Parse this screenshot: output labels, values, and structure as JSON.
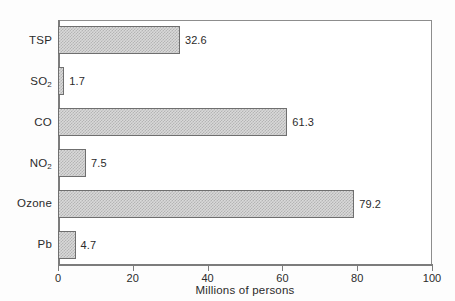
{
  "chart_data": {
    "type": "bar",
    "orientation": "horizontal",
    "title": "",
    "xlabel": "Millions of persons",
    "ylabel": "",
    "categories": [
      "TSP",
      "SO2",
      "CO",
      "NO2",
      "Ozone",
      "Pb"
    ],
    "category_labels_html": [
      "TSP",
      "SO<sub>2</sub>",
      "CO",
      "NO<sub>2</sub>",
      "Ozone",
      "Pb"
    ],
    "values": [
      32.6,
      1.7,
      61.3,
      7.5,
      79.2,
      4.7
    ],
    "value_labels": [
      "32.6",
      "1.7",
      "61.3",
      "7.5",
      "79.2",
      "4.7"
    ],
    "xlim": [
      0,
      100
    ],
    "xticks": [
      0,
      20,
      40,
      60,
      80,
      100
    ],
    "xtick_labels": [
      "0",
      "20",
      "40",
      "60",
      "80",
      "100"
    ],
    "grid": false,
    "legend": false,
    "bar_fill": "#d9d9d9",
    "bar_pattern": "checkerboard-hatch",
    "bar_border": "#6f6f6f",
    "axis_color": "#7c7c7c",
    "background": "#ffffff"
  }
}
